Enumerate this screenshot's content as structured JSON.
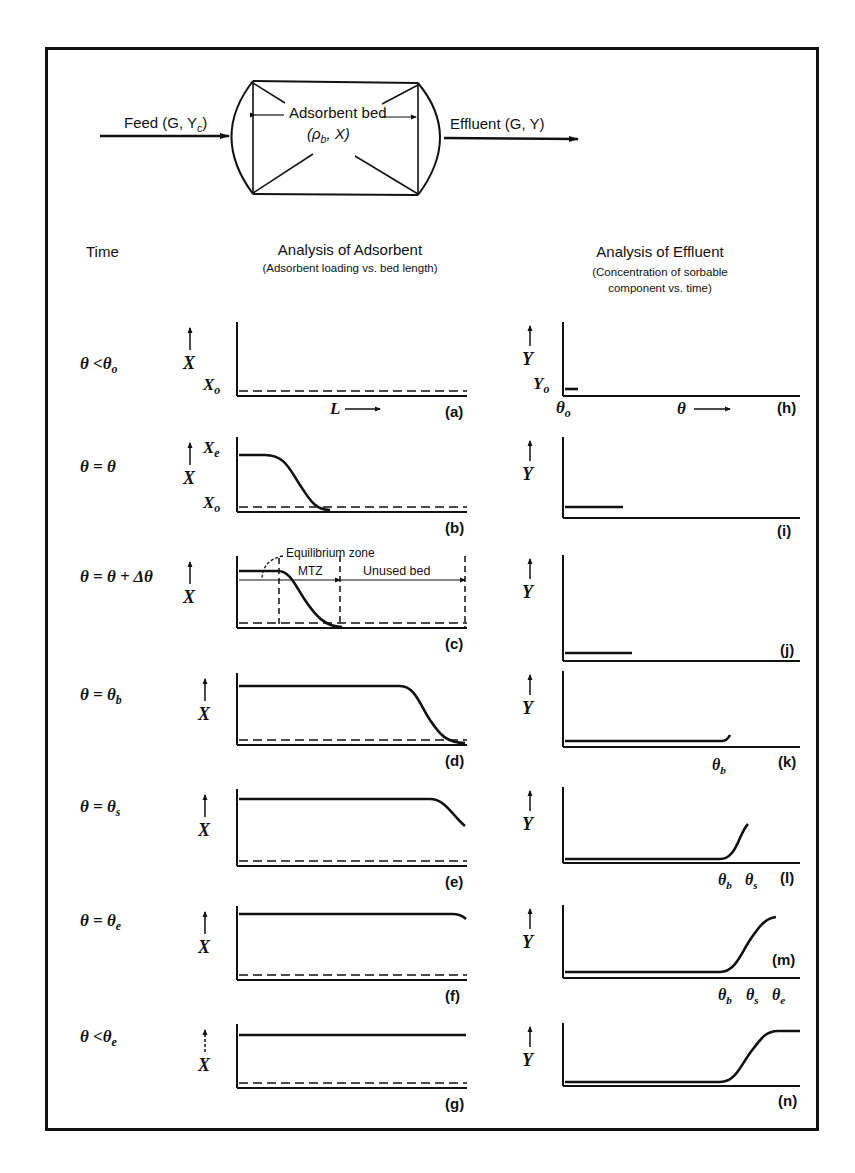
{
  "diagram": {
    "flow": {
      "feed_label": "Feed (G, Y",
      "feed_sub": "c",
      "feed_close": ")",
      "bed_label": "Adsorbent bed",
      "bed_props_open": "(ρ",
      "bed_props_sub": "b",
      "bed_props_close": ", X)",
      "effluent_label": "Effluent (G, Y)"
    },
    "headers": {
      "time": "Time",
      "adsorbent_title": "Analysis of Adsorbent",
      "adsorbent_subtitle": "(Adsorbent loading vs. bed length)",
      "effluent_title": "Analysis of Effluent",
      "effluent_subtitle_1": "(Concentration of sorbable",
      "effluent_subtitle_2": "component vs. time)"
    },
    "rows": [
      {
        "time_main": "θ <θ",
        "time_sub": "o"
      },
      {
        "time_main": "θ = θ",
        "time_sub": ""
      },
      {
        "time_main": "θ = θ + Δθ",
        "time_sub": ""
      },
      {
        "time_main": "θ = θ",
        "time_sub": "b"
      },
      {
        "time_main": "θ = θ",
        "time_sub": "s"
      },
      {
        "time_main": "θ = θ",
        "time_sub": "e"
      },
      {
        "time_main": "θ <θ",
        "time_sub": "e"
      }
    ],
    "adsorbent_panels": [
      {
        "tag": "(a)",
        "axis_label": "X",
        "x0_label": "X",
        "x0_sub": "o",
        "l_label": "L"
      },
      {
        "tag": "(b)",
        "axis_label": "X",
        "xe_label": "X",
        "xe_sub": "e",
        "x0_label": "X",
        "x0_sub": "o"
      },
      {
        "tag": "(c)",
        "axis_label": "X",
        "equilibrium_zone": "Equilibrium zone",
        "mtz": "MTZ",
        "unused_bed": "Unused bed"
      },
      {
        "tag": "(d)",
        "axis_label": "X"
      },
      {
        "tag": "(e)",
        "axis_label": "X"
      },
      {
        "tag": "(f)",
        "axis_label": "X"
      },
      {
        "tag": "(g)",
        "axis_label": "X"
      }
    ],
    "effluent_panels": [
      {
        "tag": "(h)",
        "axis_label": "Y",
        "y0_label": "Y",
        "y0_sub": "o",
        "theta0_label": "θ",
        "theta0_sub": "o",
        "theta_axis": "θ"
      },
      {
        "tag": "(i)",
        "axis_label": "Y"
      },
      {
        "tag": "(j)",
        "axis_label": "Y"
      },
      {
        "tag": "(k)",
        "axis_label": "Y",
        "marks": [
          {
            "t": "θ",
            "s": "b"
          }
        ]
      },
      {
        "tag": "(l)",
        "axis_label": "Y",
        "marks": [
          {
            "t": "θ",
            "s": "b"
          },
          {
            "t": "θ",
            "s": "s"
          }
        ]
      },
      {
        "tag": "(m)",
        "axis_label": "Y",
        "marks": [
          {
            "t": "θ",
            "s": "b"
          },
          {
            "t": "θ",
            "s": "s"
          },
          {
            "t": "θ",
            "s": "e"
          }
        ]
      },
      {
        "tag": "(n)",
        "axis_label": "Y"
      }
    ]
  }
}
